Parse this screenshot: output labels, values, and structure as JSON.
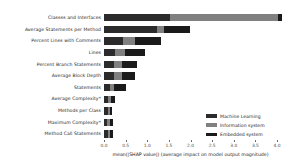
{
  "chart_data": {
    "type": "bar",
    "orientation": "horizontal",
    "stacked": true,
    "title": "",
    "subtitle": "",
    "xlabel": "mean(|SHAP value|) (average impact on model output magnitude)",
    "ylabel": "",
    "xlim": [
      0.0,
      4.0
    ],
    "grid": false,
    "legend_position": "lower-right",
    "xticks": [
      "0.0",
      "0.5",
      "1.0",
      "1.5",
      "2.0",
      "2.5",
      "3.0",
      "3.5",
      "4.0"
    ],
    "xtick_values": [
      0.0,
      0.5,
      1.0,
      1.5,
      2.0,
      2.5,
      3.0,
      3.5,
      4.0
    ],
    "categories": [
      "Classes and Interfaces",
      "Average Statements per Method",
      "Percent Lines with Comments",
      "Lines",
      "Percent Branch Statements",
      "Average Block Depth",
      "Statements",
      "Average Complexity*",
      "Methods per Class",
      "Maximum Complexity*",
      "Method Call Statements"
    ],
    "series": [
      {
        "name": "Machine Learning",
        "color": "#2b2b2b",
        "values": [
          1.52,
          1.22,
          0.43,
          0.26,
          0.24,
          0.22,
          0.13,
          0.1,
          0.09,
          0.08,
          0.09
        ]
      },
      {
        "name": "Information system",
        "color": "#808080",
        "values": [
          2.5,
          0.17,
          0.28,
          0.22,
          0.18,
          0.19,
          0.09,
          0.07,
          0.05,
          0.06,
          0.05
        ]
      },
      {
        "name": "Embedded system",
        "color": "#1a1a1a",
        "values": [
          0.09,
          0.61,
          0.6,
          0.48,
          0.34,
          0.3,
          0.3,
          0.08,
          0.04,
          0.07,
          0.06
        ]
      }
    ],
    "totals": [
      4.11,
      2.0,
      1.31,
      0.96,
      0.76,
      0.71,
      0.52,
      0.25,
      0.18,
      0.21,
      0.2
    ]
  },
  "legend": {
    "items": [
      {
        "label": "Machine Learning",
        "color": "#2b2b2b"
      },
      {
        "label": "Information system",
        "color": "#808080"
      },
      {
        "label": "Embedded system",
        "color": "#1a1a1a"
      }
    ]
  },
  "axis": {
    "x_title": "mean(|SHAP value|) (average impact on model output magnitude)"
  }
}
